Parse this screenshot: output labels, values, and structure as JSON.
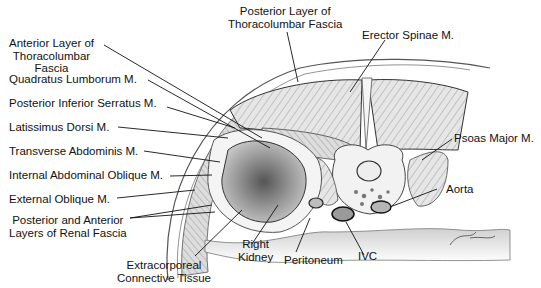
{
  "figure": {
    "labels": {
      "posterior_layer_tlf": [
        "Posterior Layer of",
        "Thoracolumbar Fascia"
      ],
      "erector_spinae": "Erector Spinae M.",
      "anterior_layer_tlf": [
        "Anterior Layer of",
        "Thoracolumbar",
        "Fascia"
      ],
      "quadratus_lumborum": "Quadratus Lumborum M.",
      "posterior_inferior_serratus": "Posterior Inferior Serratus M.",
      "latissimus_dorsi": "Latissimus Dorsi M.",
      "transverse_abdominis": "Transverse Abdominis M.",
      "internal_oblique": "Internal Abdominal Oblique M.",
      "external_oblique": "External Oblique M.",
      "renal_fascia": [
        "Posterior and Anterior",
        "Layers of Renal Fascia"
      ],
      "extracorporeal": [
        "Extracorporeal",
        "Connective Tissue"
      ],
      "right_kidney": [
        "Right",
        "Kidney"
      ],
      "peritoneum": "Peritoneum",
      "ivc": "IVC",
      "aorta": "Aorta",
      "psoas_major": "Psoas Major M."
    },
    "colors": {
      "ink": "#111111",
      "shade": "#9a9a9a",
      "light": "#d8d8d8",
      "background": "#ffffff"
    }
  }
}
